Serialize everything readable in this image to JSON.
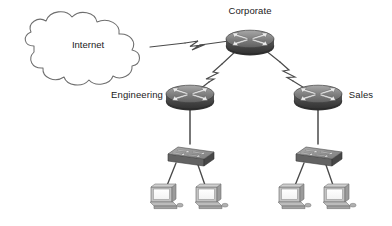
{
  "diagram": {
    "background_color": "#ffffff",
    "nodes": {
      "internet_cloud": {
        "label": "Internet",
        "type": "cloud-icon",
        "x": 88,
        "y": 44
      },
      "corporate_router": {
        "label": "Corporate",
        "type": "router-icon",
        "x": 250,
        "y": 40,
        "label_x": 250,
        "label_y": 14
      },
      "engineering_router": {
        "label": "Engineering",
        "type": "router-icon",
        "x": 190,
        "y": 95,
        "label_x": 137,
        "label_y": 98
      },
      "sales_router": {
        "label": "Sales",
        "type": "router-icon",
        "x": 318,
        "y": 95,
        "label_x": 361,
        "label_y": 98
      },
      "engineering_switch": {
        "label": "",
        "type": "switch-icon",
        "x": 190,
        "y": 152
      },
      "sales_switch": {
        "label": "",
        "type": "switch-icon",
        "x": 318,
        "y": 152
      },
      "engineering_pc_1": {
        "label": "",
        "type": "workstation-icon",
        "x": 163,
        "y": 200
      },
      "engineering_pc_2": {
        "label": "",
        "type": "workstation-icon",
        "x": 208,
        "y": 200
      },
      "sales_pc_1": {
        "label": "",
        "type": "workstation-icon",
        "x": 291,
        "y": 200
      },
      "sales_pc_2": {
        "label": "",
        "type": "workstation-icon",
        "x": 336,
        "y": 200
      }
    },
    "links": [
      {
        "name": "internet-to-corporate",
        "from": "internet_cloud",
        "to": "corporate_router",
        "style": "serial-wan",
        "has_lightning_bolt": true
      },
      {
        "name": "corporate-to-engineering",
        "from": "corporate_router",
        "to": "engineering_router",
        "style": "serial-wan",
        "has_lightning_bolt": true
      },
      {
        "name": "corporate-to-sales",
        "from": "corporate_router",
        "to": "sales_router",
        "style": "serial-wan",
        "has_lightning_bolt": true
      },
      {
        "name": "engineering-router-to-switch",
        "from": "engineering_router",
        "to": "engineering_switch",
        "style": "ethernet",
        "has_lightning_bolt": false
      },
      {
        "name": "sales-router-to-switch",
        "from": "sales_router",
        "to": "sales_switch",
        "style": "ethernet",
        "has_lightning_bolt": false
      },
      {
        "name": "engineering-switch-to-pc-1",
        "from": "engineering_switch",
        "to": "engineering_pc_1",
        "style": "ethernet",
        "has_lightning_bolt": false
      },
      {
        "name": "engineering-switch-to-pc-2",
        "from": "engineering_switch",
        "to": "engineering_pc_2",
        "style": "ethernet",
        "has_lightning_bolt": false
      },
      {
        "name": "sales-switch-to-pc-1",
        "from": "sales_switch",
        "to": "sales_pc_1",
        "style": "ethernet",
        "has_lightning_bolt": false
      },
      {
        "name": "sales-switch-to-pc-2",
        "from": "sales_switch",
        "to": "sales_pc_2",
        "style": "ethernet",
        "has_lightning_bolt": false
      }
    ],
    "colors": {
      "line": "#4a4a4a",
      "cloud_stroke": "#6e6e6e",
      "cloud_fill": "#ffffff",
      "router_top": "#8a8a8a",
      "router_body": "#4e4e4e",
      "router_dark": "#3a3a3a",
      "switch_top": "#9a9a9a",
      "switch_front": "#6a6a6a",
      "switch_side": "#4a4a4a",
      "pc_body": "#b8b8b8",
      "pc_screen": "#ffffff",
      "pc_base": "#a0a0a0",
      "text": "#1a1a1a"
    }
  }
}
